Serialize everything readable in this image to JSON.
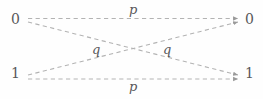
{
  "diagram": {
    "stroke_color": "#b3b3b3",
    "text_color": "#58585a",
    "background_color": "#fefefe",
    "nodes": {
      "input": [
        {
          "id": "in-0",
          "label": "0",
          "x": 24,
          "y": 19
        },
        {
          "id": "in-1",
          "label": "1",
          "x": 24,
          "y": 73
        }
      ],
      "output": [
        {
          "id": "out-0",
          "label": "0",
          "x": 240,
          "y": 19
        },
        {
          "id": "out-1",
          "label": "1",
          "x": 240,
          "y": 73
        }
      ]
    },
    "edges": [
      {
        "id": "edge-0-0",
        "from": "in-0",
        "to": "out-0",
        "label": "p",
        "kind": "straight",
        "label_x": 133,
        "label_y": 9
      },
      {
        "id": "edge-1-1",
        "from": "in-1",
        "to": "out-1",
        "label": "p",
        "kind": "straight",
        "label_x": 133,
        "label_y": 86
      },
      {
        "id": "edge-0-1",
        "from": "in-0",
        "to": "out-1",
        "label": "q",
        "kind": "cross",
        "label_x": 96,
        "label_y": 49
      },
      {
        "id": "edge-1-0",
        "from": "in-1",
        "to": "out-0",
        "label": "q",
        "kind": "cross",
        "label_x": 167,
        "label_y": 49
      }
    ],
    "line_style": "dashed",
    "crossing_point": {
      "x": 130,
      "y": 49
    }
  }
}
